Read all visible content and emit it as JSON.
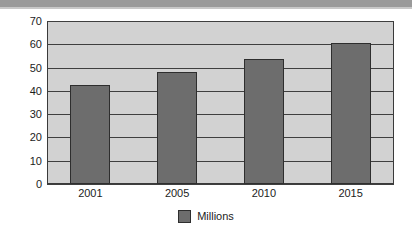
{
  "top_band": {
    "color": "#9a9a9a"
  },
  "chart_data": {
    "type": "bar",
    "title": "",
    "subtitle": "",
    "xlabel": "",
    "ylabel": "",
    "categories": [
      "2001",
      "2005",
      "2010",
      "2015"
    ],
    "series": [
      {
        "name": "Millions",
        "values": [
          42.5,
          48.2,
          53.6,
          60.5
        ],
        "color": "#6d6d6d"
      }
    ],
    "ylim": [
      0,
      70
    ],
    "ytick_values": [
      0,
      10,
      20,
      30,
      40,
      50,
      60,
      70
    ],
    "ytick_labels": [
      "0",
      "10",
      "20",
      "30",
      "40",
      "50",
      "60",
      "70"
    ],
    "grid": true,
    "grid_axis": "y",
    "legend": {
      "position": "bottom-center",
      "entries": [
        {
          "label": "Millions",
          "color": "#6d6d6d"
        }
      ]
    },
    "plot_background": "#d2d2d2",
    "gridline_color": "#3f3f3f",
    "border_color": "#3a3a3a"
  }
}
